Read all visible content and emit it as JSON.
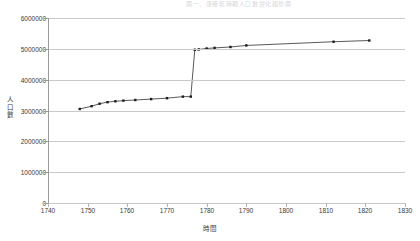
{
  "top_note": "圖一、康雍乾時期人口數變化趨勢圖",
  "axis_title_y_chars": [
    "人",
    "口",
    "數"
  ],
  "chart_data": {
    "type": "line",
    "title": "",
    "xlabel": "時間",
    "ylabel": "人口數",
    "xlim": [
      1740,
      1830
    ],
    "ylim": [
      0,
      6000000
    ],
    "xticks": [
      1740,
      1750,
      1760,
      1770,
      1780,
      1790,
      1800,
      1810,
      1820,
      1830
    ],
    "yticks": [
      0,
      1000000,
      2000000,
      3000000,
      4000000,
      5000000,
      6000000
    ],
    "xtick_labels": [
      "1740",
      "1750",
      "1760",
      "1770",
      "1780",
      "1790",
      "1800",
      "1810",
      "1820",
      "1830"
    ],
    "ytick_labels": [
      "0",
      "1000000",
      "2000000",
      "3000000",
      "4000000",
      "5000000",
      "6000000"
    ],
    "grid": true,
    "grid_axis": "y",
    "legend": false,
    "marker": "square",
    "series": [
      {
        "name": "人口數",
        "color": "#3b3b3b",
        "x": [
          1748,
          1751,
          1753,
          1755,
          1757,
          1759,
          1762,
          1766,
          1770,
          1774,
          1776,
          1777,
          1778,
          1780,
          1782,
          1786,
          1790,
          1812,
          1821
        ],
        "y": [
          3050000,
          3140000,
          3220000,
          3270000,
          3300000,
          3320000,
          3340000,
          3370000,
          3400000,
          3450000,
          3450000,
          4970000,
          4980000,
          5010000,
          5030000,
          5060000,
          5110000,
          5230000,
          5270000
        ]
      }
    ]
  }
}
